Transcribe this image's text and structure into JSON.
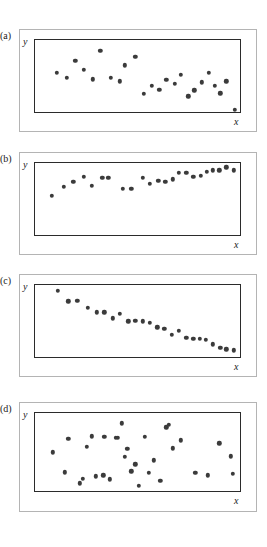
{
  "figure": {
    "title": "",
    "background_color": "#ffffff",
    "dot_color": "#3b3b3b",
    "plot_border_color": "#2b2b2b",
    "frame_border_color": "#b4b4b4"
  },
  "chart_data": [
    {
      "type": "scatter",
      "panel_label": "(a)",
      "title": "",
      "xlabel": "x",
      "ylabel": "y",
      "xlim": [
        0,
        100
      ],
      "ylim": [
        0,
        100
      ],
      "grid": false,
      "legend": "none",
      "description": "Scattered points with a weak downward drift then flattening; no clear strong linear relationship.",
      "points": [
        {
          "x": 10.5,
          "y": 56
        },
        {
          "x": 15.5,
          "y": 49
        },
        {
          "x": 19.5,
          "y": 72
        },
        {
          "x": 23.5,
          "y": 60
        },
        {
          "x": 28.0,
          "y": 47
        },
        {
          "x": 31.5,
          "y": 85
        },
        {
          "x": 36.5,
          "y": 49
        },
        {
          "x": 41.0,
          "y": 44
        },
        {
          "x": 43.5,
          "y": 66
        },
        {
          "x": 48.5,
          "y": 77
        },
        {
          "x": 52.5,
          "y": 27
        },
        {
          "x": 56.5,
          "y": 38
        },
        {
          "x": 60.0,
          "y": 33
        },
        {
          "x": 63.5,
          "y": 46
        },
        {
          "x": 67.5,
          "y": 41
        },
        {
          "x": 70.5,
          "y": 53
        },
        {
          "x": 74.0,
          "y": 24
        },
        {
          "x": 77.0,
          "y": 32
        },
        {
          "x": 80.5,
          "y": 43
        },
        {
          "x": 84.0,
          "y": 56
        },
        {
          "x": 87.0,
          "y": 38
        },
        {
          "x": 89.5,
          "y": 28
        },
        {
          "x": 92.5,
          "y": 44
        },
        {
          "x": 96.5,
          "y": 6
        }
      ]
    },
    {
      "type": "scatter",
      "panel_label": "(b)",
      "title": "",
      "xlabel": "x",
      "ylabel": "y",
      "xlim": [
        0,
        100
      ],
      "ylim": [
        0,
        100
      ],
      "grid": false,
      "legend": "none",
      "description": "Strong positive association; points rise from lower-left to upper-right with moderate scatter.",
      "points": [
        {
          "x": 8.0,
          "y": 56
        },
        {
          "x": 14.0,
          "y": 68
        },
        {
          "x": 18.5,
          "y": 75
        },
        {
          "x": 23.5,
          "y": 81
        },
        {
          "x": 27.5,
          "y": 69
        },
        {
          "x": 32.5,
          "y": 80
        },
        {
          "x": 35.5,
          "y": 80
        },
        {
          "x": 42.5,
          "y": 65
        },
        {
          "x": 46.5,
          "y": 65
        },
        {
          "x": 52.0,
          "y": 80
        },
        {
          "x": 55.5,
          "y": 72
        },
        {
          "x": 59.5,
          "y": 76
        },
        {
          "x": 63.0,
          "y": 75
        },
        {
          "x": 66.5,
          "y": 78
        },
        {
          "x": 69.5,
          "y": 87
        },
        {
          "x": 73.0,
          "y": 87
        },
        {
          "x": 76.5,
          "y": 81
        },
        {
          "x": 80.0,
          "y": 83
        },
        {
          "x": 83.0,
          "y": 88
        },
        {
          "x": 86.0,
          "y": 90
        },
        {
          "x": 89.0,
          "y": 90
        },
        {
          "x": 92.5,
          "y": 94
        },
        {
          "x": 96.0,
          "y": 90
        }
      ]
    },
    {
      "type": "scatter",
      "panel_label": "(c)",
      "title": "",
      "xlabel": "x",
      "ylabel": "y",
      "xlim": [
        0,
        100
      ],
      "ylim": [
        0,
        100
      ],
      "grid": false,
      "legend": "none",
      "description": "Strong negative association; points fall steadily from upper-left to lower-right with tight scatter.",
      "points": [
        {
          "x": 11.0,
          "y": 92
        },
        {
          "x": 16.0,
          "y": 78
        },
        {
          "x": 20.5,
          "y": 79
        },
        {
          "x": 25.5,
          "y": 69
        },
        {
          "x": 30.0,
          "y": 63
        },
        {
          "x": 33.5,
          "y": 63
        },
        {
          "x": 37.5,
          "y": 55
        },
        {
          "x": 41.0,
          "y": 61
        },
        {
          "x": 45.0,
          "y": 51
        },
        {
          "x": 48.5,
          "y": 52
        },
        {
          "x": 52.0,
          "y": 51
        },
        {
          "x": 55.5,
          "y": 49
        },
        {
          "x": 59.0,
          "y": 43
        },
        {
          "x": 62.5,
          "y": 41
        },
        {
          "x": 66.0,
          "y": 33
        },
        {
          "x": 69.5,
          "y": 38
        },
        {
          "x": 73.0,
          "y": 29
        },
        {
          "x": 76.5,
          "y": 27
        },
        {
          "x": 79.5,
          "y": 27
        },
        {
          "x": 82.5,
          "y": 26
        },
        {
          "x": 86.0,
          "y": 20
        },
        {
          "x": 89.5,
          "y": 15
        },
        {
          "x": 92.5,
          "y": 13
        },
        {
          "x": 96.0,
          "y": 12
        }
      ]
    },
    {
      "type": "scatter",
      "panel_label": "(d)",
      "title": "",
      "xlabel": "x",
      "ylabel": "y",
      "xlim": [
        0,
        100
      ],
      "ylim": [
        0,
        100
      ],
      "grid": false,
      "legend": "none",
      "description": "Random cloud of points; no association between x and y.",
      "points": [
        {
          "x": 8.5,
          "y": 51
        },
        {
          "x": 14.5,
          "y": 26
        },
        {
          "x": 16.0,
          "y": 68
        },
        {
          "x": 21.5,
          "y": 12
        },
        {
          "x": 23.0,
          "y": 18
        },
        {
          "x": 25.0,
          "y": 58
        },
        {
          "x": 27.5,
          "y": 71
        },
        {
          "x": 29.5,
          "y": 21
        },
        {
          "x": 33.0,
          "y": 22
        },
        {
          "x": 33.5,
          "y": 70
        },
        {
          "x": 36.0,
          "y": 17
        },
        {
          "x": 39.0,
          "y": 69
        },
        {
          "x": 40.0,
          "y": 69
        },
        {
          "x": 42.0,
          "y": 87
        },
        {
          "x": 43.5,
          "y": 45
        },
        {
          "x": 44.5,
          "y": 55
        },
        {
          "x": 46.5,
          "y": 27
        },
        {
          "x": 48.5,
          "y": 36
        },
        {
          "x": 50.0,
          "y": 9
        },
        {
          "x": 53.0,
          "y": 70
        },
        {
          "x": 55.0,
          "y": 25
        },
        {
          "x": 57.5,
          "y": 41
        },
        {
          "x": 60.5,
          "y": 15
        },
        {
          "x": 63.5,
          "y": 82
        },
        {
          "x": 64.5,
          "y": 85
        },
        {
          "x": 66.5,
          "y": 56
        },
        {
          "x": 70.5,
          "y": 66
        },
        {
          "x": 77.5,
          "y": 25
        },
        {
          "x": 83.5,
          "y": 22
        },
        {
          "x": 89.0,
          "y": 62
        },
        {
          "x": 94.5,
          "y": 46
        },
        {
          "x": 95.5,
          "y": 24
        }
      ]
    }
  ]
}
